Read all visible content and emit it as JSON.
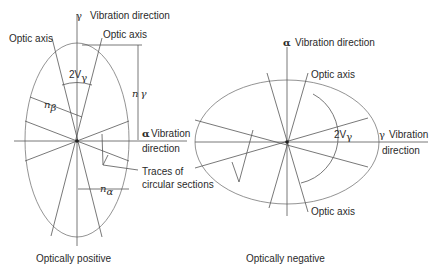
{
  "positive": {
    "gamma_label": "γ",
    "gamma_vib": "Vibration direction",
    "optic_axis_left": "Optic axis",
    "optic_axis_right": "Optic axis",
    "angle": "2V",
    "angle_sub": "γ",
    "n_gamma": "n",
    "n_gamma_sub": "γ",
    "n_beta": "n",
    "n_beta_sub": "β",
    "n_alpha": "n",
    "n_alpha_sub": "α",
    "alpha_label": "α",
    "alpha_vib": "Vibration",
    "alpha_dir": "direction",
    "traces_1": "Traces of",
    "traces_2": "circular sections",
    "caption": "Optically  positive"
  },
  "negative": {
    "alpha_label": "α",
    "alpha_vib": "Vibration direction",
    "optic_axis_top": "Optic axis",
    "optic_axis_bottom": "Optic axis",
    "angle": "2V",
    "angle_sub": "γ",
    "gamma_label": "γ",
    "gamma_vib": "Vibration",
    "gamma_dir": "direction",
    "caption": "Optically  negative"
  }
}
